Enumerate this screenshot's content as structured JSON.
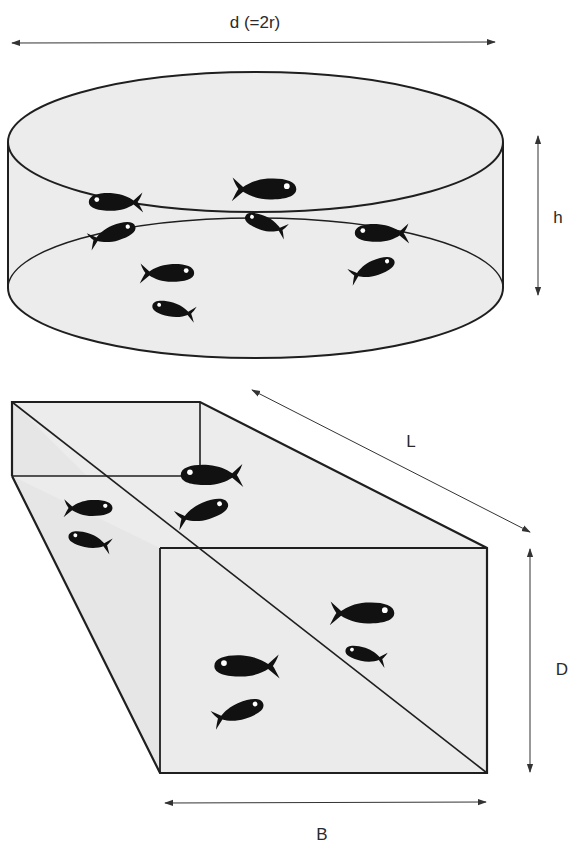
{
  "figure": {
    "type": "diagram",
    "colors": {
      "tank_fill": "#ececec",
      "outline": "#1f1f1f",
      "fish": "#111111",
      "arrow": "#333333",
      "background": "#ffffff"
    }
  },
  "cylinder_tank": {
    "diameter_label": "d (=2r)",
    "height_label": "h",
    "fish_count": 9
  },
  "rectangular_tank": {
    "length_label": "L",
    "depth_label": "D",
    "breadth_label": "B",
    "fish_count": 8
  }
}
